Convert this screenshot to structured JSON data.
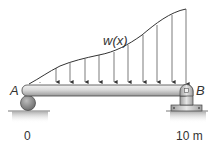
{
  "diagram": {
    "load_label": "w(x)",
    "support_a_label": "A",
    "support_b_label": "B",
    "x_start_label": "0",
    "x_end_label": "10 m",
    "load_arrow_count": 10,
    "support_a_type": "roller",
    "support_b_type": "pin",
    "colors": {
      "beam": "#d6d6d6",
      "beam_outline": "#444444",
      "load_curve": "#333333",
      "ground": "#bfbfbf"
    }
  }
}
